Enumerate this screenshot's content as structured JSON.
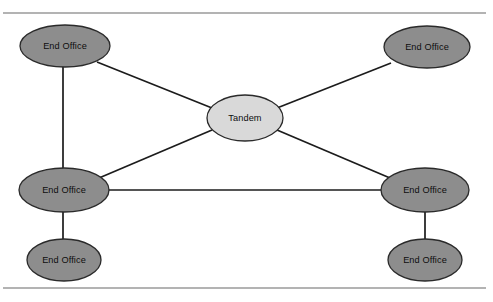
{
  "figure": {
    "width": 493,
    "height": 302,
    "background_color": "#ffffff"
  },
  "style": {
    "end_office_fill": "#8d8d8d",
    "tandem_fill": "#d9d9d9",
    "node_stroke": "#2a2a2a",
    "edge_color": "#1c1c1c",
    "rule_color": "#9a9a9a",
    "label_color": "#0d0d0d"
  },
  "rules": [
    {
      "name": "top-rule",
      "x1": 3,
      "y1": 13,
      "x2": 486,
      "y2": 13
    },
    {
      "name": "bottom-rule",
      "x1": 3,
      "y1": 288,
      "x2": 486,
      "y2": 288
    }
  ],
  "nodes": [
    {
      "id": "end-office-top-left",
      "label": "End Office",
      "role": "end-office",
      "cx": 65,
      "cy": 46,
      "rx": 45,
      "ry": 21
    },
    {
      "id": "end-office-top-right",
      "label": "End Office",
      "role": "end-office",
      "cx": 427,
      "cy": 47,
      "rx": 43,
      "ry": 21
    },
    {
      "id": "tandem-center",
      "label": "Tandem",
      "role": "tandem",
      "cx": 245,
      "cy": 118,
      "rx": 38,
      "ry": 23
    },
    {
      "id": "end-office-mid-left",
      "label": "End Office",
      "role": "end-office",
      "cx": 64,
      "cy": 190,
      "rx": 45,
      "ry": 22
    },
    {
      "id": "end-office-mid-right",
      "label": "End Office",
      "role": "end-office",
      "cx": 425,
      "cy": 190,
      "rx": 44,
      "ry": 22
    },
    {
      "id": "end-office-bottom-left",
      "label": "End Office",
      "role": "end-office",
      "cx": 64,
      "cy": 260,
      "rx": 37,
      "ry": 21
    },
    {
      "id": "end-office-bottom-right",
      "label": "End Office",
      "role": "end-office",
      "cx": 425,
      "cy": 260,
      "rx": 37,
      "ry": 21
    }
  ],
  "edges": [
    {
      "id": "edge-tl-tandem",
      "from": "end-office-top-left",
      "to": "tandem-center",
      "x1": 97,
      "y1": 62,
      "x2": 212,
      "y2": 108
    },
    {
      "id": "edge-tr-tandem",
      "from": "end-office-top-right",
      "to": "tandem-center",
      "x1": 391,
      "y1": 63,
      "x2": 277,
      "y2": 108
    },
    {
      "id": "edge-ml-tandem",
      "from": "end-office-mid-left",
      "to": "tandem-center",
      "x1": 99,
      "y1": 178,
      "x2": 212,
      "y2": 130
    },
    {
      "id": "edge-mr-tandem",
      "from": "end-office-mid-right",
      "to": "tandem-center",
      "x1": 390,
      "y1": 178,
      "x2": 277,
      "y2": 130
    },
    {
      "id": "edge-tl-ml",
      "from": "end-office-top-left",
      "to": "end-office-mid-left",
      "x1": 63,
      "y1": 66,
      "x2": 63,
      "y2": 169
    },
    {
      "id": "edge-ml-mr",
      "from": "end-office-mid-left",
      "to": "end-office-mid-right",
      "x1": 108,
      "y1": 190,
      "x2": 382,
      "y2": 190
    },
    {
      "id": "edge-ml-bl",
      "from": "end-office-mid-left",
      "to": "end-office-bottom-left",
      "x1": 63,
      "y1": 211,
      "x2": 63,
      "y2": 240
    },
    {
      "id": "edge-mr-br",
      "from": "end-office-mid-right",
      "to": "end-office-bottom-right",
      "x1": 425,
      "y1": 211,
      "x2": 425,
      "y2": 240
    }
  ]
}
